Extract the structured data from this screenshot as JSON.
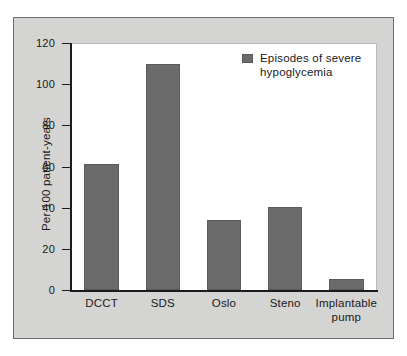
{
  "chart_data": {
    "type": "bar",
    "title": "",
    "subtitle": "",
    "xlabel": "",
    "ylabel": "Per 100 patient-years",
    "categories": [
      "DCCT",
      "SDS",
      "Oslo",
      "Steno",
      "Implantable pump"
    ],
    "values": [
      61,
      110,
      34,
      40.5,
      5.5
    ],
    "series": [
      {
        "name": "Episodes of severe hypoglycemia",
        "values": [
          61,
          110,
          34,
          40.5,
          5.5
        ]
      }
    ],
    "ylim": [
      0,
      120
    ],
    "yticks": [
      0,
      20,
      40,
      60,
      80,
      100,
      120
    ],
    "ytick_labels": [
      "0",
      "20",
      "40",
      "60",
      "80",
      "100",
      "120"
    ],
    "grid": false,
    "legend_position": "top-right",
    "legend": [
      "Episodes of severe hypoglycemia"
    ],
    "colors": {
      "bar_fill": "#6b6b6b",
      "bar_edge": "#5a5a5a",
      "axis": "#1b1b1b",
      "plot_background": "#ffffff",
      "figure_background": "#d4d4d2",
      "figure_border": "#6e6e6e",
      "text": "#1a1a1a"
    }
  },
  "legend_entry": {
    "label_line1": "Episodes of severe",
    "label_line2": "hypoglycemia",
    "label": "Episodes of severe hypoglycemia"
  },
  "x_labels": [
    {
      "line1": "DCCT",
      "line2": ""
    },
    {
      "line1": "SDS",
      "line2": ""
    },
    {
      "line1": "Oslo",
      "line2": ""
    },
    {
      "line1": "Steno",
      "line2": ""
    },
    {
      "line1": "Implantable",
      "line2": "pump"
    }
  ]
}
